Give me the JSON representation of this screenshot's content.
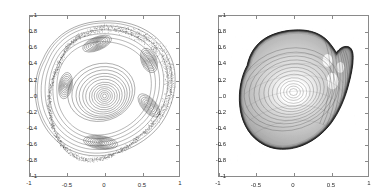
{
  "figure": {
    "title": "",
    "panel_count": 2,
    "background_color": "#ffffff",
    "ink_color": "#303030",
    "axis_color": "#8a8a8a"
  },
  "chart_data": [
    {
      "type": "scatter",
      "id": "poincare-section",
      "title": "",
      "xlabel": "",
      "ylabel": "",
      "xlim": [
        -1,
        1
      ],
      "ylim": [
        -1,
        1
      ],
      "xticks": [
        -1,
        -0.5,
        0,
        0.5,
        1
      ],
      "xticklabels": [
        "-1",
        "-0.5",
        "0",
        "0.5",
        "1"
      ],
      "yticks": [
        -1,
        -0.8,
        -0.6,
        -0.4,
        -0.2,
        0,
        0.2,
        0.4,
        0.6,
        0.8,
        1
      ],
      "yticklabels": [
        "-1",
        "-0.8",
        "-0.6",
        "-0.4",
        "-0.2",
        "0",
        "0.2",
        "0.4",
        "0.6",
        "0.8",
        "1"
      ],
      "grid": false,
      "legend": null,
      "description": "Poincare surface of section: nested invariant tori around a central elliptic fixed point, five surrounding island chains, enclosed by a chaotic stochastic layer.",
      "features": {
        "central_fixed_point": [
          0.0,
          0.0
        ],
        "island_centers": [
          [
            -0.1,
            0.65
          ],
          [
            0.6,
            0.42
          ],
          [
            -0.52,
            0.14
          ],
          [
            0.6,
            -0.12
          ],
          [
            -0.05,
            -0.58
          ]
        ],
        "outer_boundary": [
          [
            -0.62,
            0.38
          ],
          [
            -0.5,
            0.6
          ],
          [
            -0.34,
            0.74
          ],
          [
            -0.14,
            0.82
          ],
          [
            0.06,
            0.85
          ],
          [
            0.26,
            0.82
          ],
          [
            0.44,
            0.76
          ],
          [
            0.6,
            0.68
          ],
          [
            0.74,
            0.56
          ],
          [
            0.84,
            0.4
          ],
          [
            0.88,
            0.22
          ],
          [
            0.86,
            0.02
          ],
          [
            0.78,
            -0.18
          ],
          [
            0.64,
            -0.36
          ],
          [
            0.46,
            -0.52
          ],
          [
            0.26,
            -0.66
          ],
          [
            0.04,
            -0.76
          ],
          [
            -0.18,
            -0.8
          ],
          [
            -0.38,
            -0.76
          ],
          [
            -0.54,
            -0.64
          ],
          [
            -0.66,
            -0.46
          ],
          [
            -0.72,
            -0.26
          ],
          [
            -0.74,
            -0.04
          ],
          [
            -0.7,
            0.18
          ]
        ]
      }
    },
    {
      "type": "heatmap",
      "id": "husimi-contour",
      "title": "",
      "xlabel": "",
      "ylabel": "",
      "xlim": [
        -1,
        1
      ],
      "ylim": [
        -1,
        1
      ],
      "xticks": [
        -1,
        -0.5,
        0,
        0.5,
        1
      ],
      "xticklabels": [
        "-1",
        "-0.5",
        "0",
        "0.5",
        "1"
      ],
      "yticks": [
        -1,
        -0.8,
        -0.6,
        -0.4,
        -0.2,
        0,
        0.2,
        0.4,
        0.6,
        0.8,
        1
      ],
      "yticklabels": [
        "-1",
        "-0.8",
        "-0.6",
        "-0.4",
        "-0.2",
        "0",
        "0.2",
        "0.4",
        "0.6",
        "0.8",
        "1"
      ],
      "grid": false,
      "legend": null,
      "description": "Contour / density plot of a quantum phase-space (Husimi) distribution supported on the same shield-shaped region, with a heavy dark boundary contour, a bright core near (0.0,0.05), and a cusp notch at the upper right.",
      "features": {
        "core_maximum": [
          0.0,
          0.05
        ],
        "secondary_maxima": [
          [
            0.52,
            0.18
          ],
          [
            0.46,
            0.44
          ]
        ],
        "cusp_notch": [
          0.46,
          0.55
        ],
        "support_boundary": [
          [
            -0.6,
            0.36
          ],
          [
            -0.54,
            0.52
          ],
          [
            -0.42,
            0.64
          ],
          [
            -0.24,
            0.72
          ],
          [
            -0.04,
            0.76
          ],
          [
            0.14,
            0.76
          ],
          [
            0.3,
            0.7
          ],
          [
            0.4,
            0.58
          ],
          [
            0.5,
            0.5
          ],
          [
            0.6,
            0.52
          ],
          [
            0.68,
            0.48
          ],
          [
            0.72,
            0.38
          ],
          [
            0.7,
            0.24
          ],
          [
            0.66,
            0.08
          ],
          [
            0.6,
            -0.1
          ],
          [
            0.52,
            -0.28
          ],
          [
            0.4,
            -0.44
          ],
          [
            0.24,
            -0.56
          ],
          [
            0.06,
            -0.62
          ],
          [
            -0.14,
            -0.62
          ],
          [
            -0.32,
            -0.56
          ],
          [
            -0.46,
            -0.44
          ],
          [
            -0.56,
            -0.28
          ],
          [
            -0.62,
            -0.1
          ],
          [
            -0.63,
            0.12
          ]
        ]
      }
    }
  ],
  "axes_meta": {
    "left": {
      "name": "left-axes"
    },
    "right": {
      "name": "right-axes"
    }
  }
}
